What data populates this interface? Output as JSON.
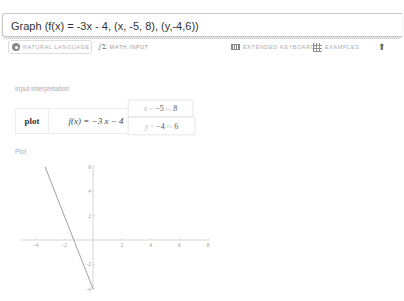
{
  "query": {
    "value": "Graph (f(x) = -3x - 4, (x, -5, 8), (y,-4,6))",
    "placeholder": ""
  },
  "toolbar": {
    "natural_language": "NATURAL LANGUAGE",
    "math_input": "MATH INPUT",
    "extended_keyboard": "EXTENDED KEYBOARD",
    "examples": "EXAMPLES",
    "icons": {
      "natural_language": "gear-icon",
      "math_input": "sigma-icon",
      "extended_keyboard": "keyboard-icon",
      "examples": "grid-icon",
      "share": "upload-icon"
    }
  },
  "input_interpretation": {
    "label": "Input interpretation",
    "command": "plot",
    "function": "f(x) = −3 x − 4",
    "x_range": {
      "var": "x",
      "eq": "=",
      "from": "−5",
      "to_word": "to",
      "to": "8"
    },
    "y_range": {
      "var": "y",
      "eq": "=",
      "from": "−4",
      "to_word": "to",
      "to": "6"
    }
  },
  "plot_section": {
    "label": "Plot"
  },
  "chart_data": {
    "type": "line",
    "title": "",
    "xlabel": "",
    "ylabel": "",
    "xlim": [
      -5,
      8
    ],
    "ylim": [
      -4,
      6
    ],
    "x_ticks": [
      "-4",
      "-2",
      "2",
      "4",
      "6",
      "8"
    ],
    "y_ticks": [
      "6",
      "4",
      "2",
      "-2",
      "-4"
    ],
    "series": [
      {
        "name": "f(x) = -3x - 4",
        "x": [
          -3.33,
          0
        ],
        "y": [
          6,
          -4
        ]
      }
    ],
    "grid": false,
    "line_color": "#888888"
  }
}
